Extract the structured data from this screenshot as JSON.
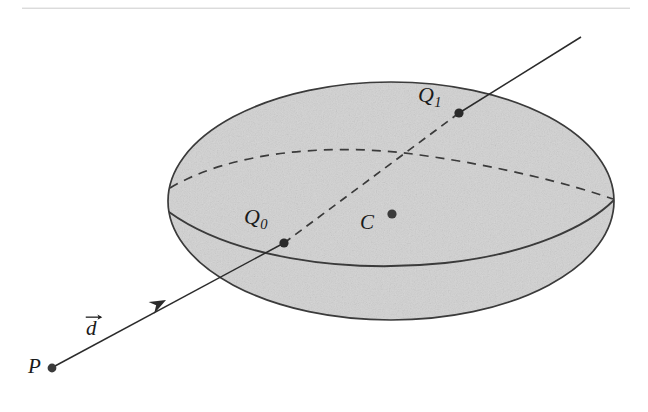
{
  "figure": {
    "background_color": "#ffffff",
    "ink_color": "#2b2b2b",
    "solid_color": "#3a3a3a",
    "fill_color": "#d2d2d2",
    "rule": {
      "name": "top-horizontal-rule",
      "x1": 22,
      "y1": 6,
      "x2": 630,
      "y2": 6,
      "stroke_width": 2.2
    },
    "ellipsoid": {
      "name": "shaded-ellipsoid",
      "cx": 391,
      "cy": 201,
      "rx": 223,
      "ry": 119,
      "fill": "#d2d2d2",
      "stroke": "#3a3a3a",
      "stroke_width": 1.7
    },
    "equator_hidden": {
      "name": "dashed-equator-arc",
      "path": "M 170 188 C 230 152, 330 142, 420 155 C 500 166, 570 184, 613 199",
      "dash": "9 7",
      "stroke_width": 1.7
    },
    "equator_visible": {
      "name": "solid-equator-arc",
      "path": "M 169 212 C 230 256, 340 274, 445 263 C 530 254, 588 226, 614 200",
      "stroke_width": 1.8
    },
    "ray": {
      "name": "ray-from-P",
      "origin": {
        "x": 52,
        "y": 368
      },
      "end": {
        "x": 581,
        "y": 37
      },
      "visible_segments": [
        {
          "x1": 55,
          "y1": 366,
          "x2": 284,
          "y2": 243
        },
        {
          "x1": 459,
          "y1": 113,
          "x2": 581,
          "y2": 37
        }
      ],
      "hidden_segment": {
        "x1": 284,
        "y1": 243,
        "x2": 459,
        "y2": 113
      },
      "hidden_dash": "8 6",
      "stroke_width": 1.5,
      "arrowhead": {
        "x": 166,
        "y": 300,
        "size": 11,
        "angle_deg": -28.5
      }
    },
    "points": [
      {
        "name": "point-P",
        "label": "P",
        "sub": "",
        "x": 52,
        "y": 368,
        "r": 4.4,
        "label_x": 28,
        "label_y": 356
      },
      {
        "name": "point-Q0",
        "label": "Q",
        "sub": "0",
        "x": 284,
        "y": 243,
        "r": 4.6,
        "label_x": 244,
        "label_y": 206
      },
      {
        "name": "point-Q1",
        "label": "Q",
        "sub": "1",
        "x": 459,
        "y": 113,
        "r": 4.6,
        "label_x": 418,
        "label_y": 84
      },
      {
        "name": "point-C",
        "label": "C",
        "sub": "",
        "x": 392,
        "y": 214,
        "r": 4.6,
        "label_x": 360,
        "label_y": 212
      }
    ],
    "labels": {
      "P": "P",
      "Q": "Q",
      "Q0_sub": "0",
      "Q1_sub": "1",
      "C": "C",
      "d": "d"
    }
  }
}
